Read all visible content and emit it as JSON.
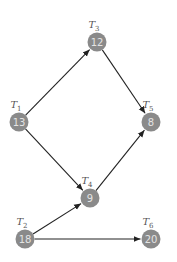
{
  "diagram": {
    "type": "task-dag",
    "colors": {
      "node": "#8a8a8a",
      "node_text": "#e4e4e4",
      "edge": "#222222",
      "label": "#555555"
    },
    "nodes": [
      {
        "id": "T1",
        "label": "T",
        "sub": "1",
        "value": "13",
        "x": 19,
        "y": 122
      },
      {
        "id": "T2",
        "label": "T",
        "sub": "2",
        "value": "18",
        "x": 25,
        "y": 239
      },
      {
        "id": "T3",
        "label": "T",
        "sub": "3",
        "value": "12",
        "x": 97,
        "y": 42
      },
      {
        "id": "T4",
        "label": "T",
        "sub": "4",
        "value": "9",
        "x": 90,
        "y": 198
      },
      {
        "id": "T5",
        "label": "T",
        "sub": "5",
        "value": "8",
        "x": 151,
        "y": 122
      },
      {
        "id": "T6",
        "label": "T",
        "sub": "6",
        "value": "20",
        "x": 151,
        "y": 239
      }
    ],
    "edges": [
      {
        "from": "T1",
        "to": "T3"
      },
      {
        "from": "T1",
        "to": "T4"
      },
      {
        "from": "T3",
        "to": "T5"
      },
      {
        "from": "T4",
        "to": "T5"
      },
      {
        "from": "T2",
        "to": "T4"
      },
      {
        "from": "T2",
        "to": "T6"
      }
    ]
  }
}
